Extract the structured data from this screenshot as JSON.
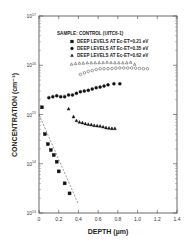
{
  "chart_data": {
    "type": "scatter",
    "title": "SAMPLE: CONTROL (UITC6-1)",
    "xlabel": "DEPTH (µm)",
    "ylabel": "CONCENTRATION (cm⁻³)",
    "xlim": [
      0,
      1.4
    ],
    "ylim": [
      10000000000000.0,
      1e+17
    ],
    "yscale": "log",
    "x_ticks": [
      "0",
      "0.2",
      "0.4",
      "0.6",
      "0.8",
      "1.0",
      "1.2",
      "1.4"
    ],
    "y_ticks": [
      {
        "base": "10",
        "exp": "17"
      },
      {
        "base": "10",
        "exp": "16"
      },
      {
        "base": "10",
        "exp": "15"
      },
      {
        "base": "10",
        "exp": "14"
      },
      {
        "base": "10",
        "exp": "13"
      }
    ],
    "legend_position": "top-right",
    "legend": [
      {
        "marker": "square",
        "label": "DEEP LEVELS AT Ec-ET=0.21 eV"
      },
      {
        "marker": "circle",
        "label": "DEEP LEVELS AT Ec-ET=0.35 eV"
      },
      {
        "marker": "triangle",
        "label": "DEEP LEVELS AT Ec-ET=0.62 eV"
      }
    ],
    "series": [
      {
        "name": "Ec-ET=0.21 eV",
        "marker": "square",
        "filled": true,
        "x": [
          0.03,
          0.06,
          0.09,
          0.12,
          0.15,
          0.18,
          0.2,
          0.26,
          0.31
        ],
        "y": [
          1400000000000000.0,
          400000000000000.0,
          250000000000000.0,
          190000000000000.0,
          150000000000000.0,
          110000000000000.0,
          70000000000000.0,
          40000000000000.0,
          25000000000000.0
        ]
      },
      {
        "name": "Ec-ET=0.35 eV",
        "marker": "circle",
        "filled": true,
        "x": [
          0.1,
          0.14,
          0.18,
          0.22,
          0.26,
          0.3,
          0.34,
          0.38,
          0.42,
          0.46,
          0.5,
          0.54,
          0.58,
          0.62,
          0.66,
          0.7,
          0.76,
          0.82
        ],
        "y": [
          2200000000000000.0,
          2300000000000000.0,
          2400000000000000.0,
          2300000000000000.0,
          2300000000000000.0,
          2500000000000000.0,
          2500000000000000.0,
          2700000000000000.0,
          2900000000000000.0,
          3000000000000000.0,
          3100000000000000.0,
          3300000000000000.0,
          3500000000000000.0,
          3600000000000000.0,
          3800000000000000.0,
          4000000000000000.0,
          4200000000000000.0,
          4200000000000000.0
        ]
      },
      {
        "name": "Ec-ET=0.62 eV",
        "marker": "triangle",
        "filled": true,
        "x": [
          0.3,
          0.35,
          0.38,
          0.41,
          0.44,
          0.47,
          0.5,
          0.53,
          0.56,
          0.59,
          0.62,
          0.65,
          0.68,
          0.71,
          0.74,
          0.77
        ],
        "y": [
          1300000000000000.0,
          900000000000000.0,
          750000000000000.0,
          700000000000000.0,
          680000000000000.0,
          650000000000000.0,
          630000000000000.0,
          620000000000000.0,
          600000000000000.0,
          590000000000000.0,
          580000000000000.0,
          560000000000000.0,
          540000000000000.0,
          530000000000000.0,
          520000000000000.0,
          520000000000000.0
        ]
      },
      {
        "name": "hollow triangles (upper)",
        "marker": "triangle",
        "filled": false,
        "x": [
          0.33,
          0.37,
          0.41,
          0.45,
          0.49,
          0.53,
          0.57,
          0.61,
          0.65,
          0.69,
          0.73,
          0.77,
          0.81,
          0.85,
          0.89,
          0.93,
          0.97
        ],
        "y": [
          1.05e+16,
          1.08e+16,
          1.1e+16,
          1.1e+16,
          1.12e+16,
          1.12e+16,
          1.12e+16,
          1.13e+16,
          1.13e+16,
          1.15e+16,
          1.13e+16,
          1.12e+16,
          1.12e+16,
          1.12e+16,
          1.12e+16,
          1.15e+16,
          1.05e+16
        ]
      },
      {
        "name": "hollow circles (upper)",
        "marker": "circle",
        "filled": false,
        "x": [
          0.42,
          0.46,
          0.5,
          0.54,
          0.58,
          0.62,
          0.66,
          0.7,
          0.74,
          0.78,
          0.82,
          0.86,
          0.9,
          0.94,
          0.98,
          1.02,
          1.06,
          1.1
        ],
        "y": [
          6500000000000000.0,
          7000000000000000.0,
          7500000000000000.0,
          7800000000000000.0,
          8200000000000000.0,
          8500000000000000.0,
          8500000000000000.0,
          8500000000000000.0,
          8600000000000000.0,
          8700000000000000.0,
          8800000000000000.0,
          8800000000000000.0,
          8800000000000000.0,
          8800000000000000.0,
          8700000000000000.0,
          8600000000000000.0,
          8500000000000000.0,
          8500000000000000.0
        ]
      }
    ],
    "fit_line": {
      "style": "dashed",
      "x": [
        0,
        0.4
      ],
      "y": [
        1000000000000000.0,
        15000000000000.0
      ]
    }
  }
}
